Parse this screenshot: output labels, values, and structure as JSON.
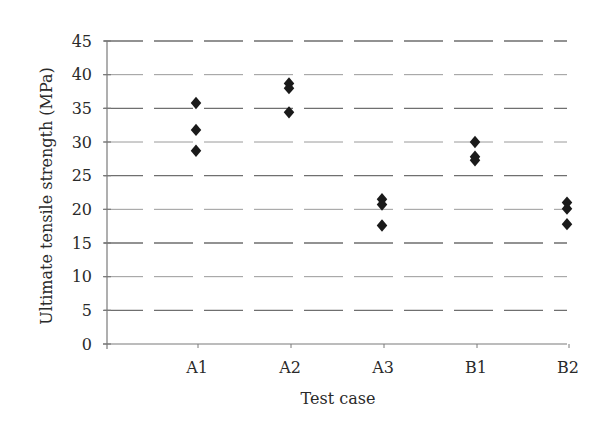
{
  "chart_data": {
    "type": "scatter",
    "title": "",
    "xlabel": "Test case",
    "ylabel": "Ultimate tensile strength (MPa)",
    "categories": [
      "A1",
      "A2",
      "A3",
      "B1",
      "B2"
    ],
    "ylim": [
      0,
      45
    ],
    "yticks": [
      0,
      5,
      10,
      15,
      20,
      25,
      30,
      35,
      40,
      45
    ],
    "grid": "horizontal dashed",
    "legend": "none",
    "marker": "diamond",
    "marker_color": "#1a1a1a",
    "series": [
      {
        "name": "Ultimate tensile strength",
        "points": [
          {
            "x": "A1",
            "y": 35.8
          },
          {
            "x": "A1",
            "y": 31.8
          },
          {
            "x": "A1",
            "y": 28.7
          },
          {
            "x": "A2",
            "y": 38.7
          },
          {
            "x": "A2",
            "y": 38.0
          },
          {
            "x": "A2",
            "y": 34.4
          },
          {
            "x": "A3",
            "y": 21.5
          },
          {
            "x": "A3",
            "y": 20.7
          },
          {
            "x": "A3",
            "y": 17.6
          },
          {
            "x": "B1",
            "y": 30.0
          },
          {
            "x": "B1",
            "y": 27.8
          },
          {
            "x": "B1",
            "y": 27.3
          },
          {
            "x": "B2",
            "y": 21.0
          },
          {
            "x": "B2",
            "y": 20.1
          },
          {
            "x": "B2",
            "y": 17.8
          }
        ]
      }
    ]
  }
}
